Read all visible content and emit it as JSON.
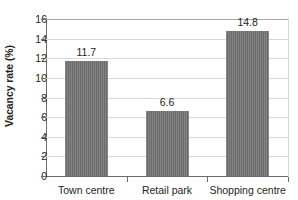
{
  "chart_data": {
    "type": "bar",
    "title": "",
    "xlabel": "",
    "ylabel": "Vacancy rate (%)",
    "categories": [
      "Town centre",
      "Retail park",
      "Shopping centre"
    ],
    "values": [
      11.7,
      6.6,
      14.8
    ],
    "value_labels": [
      "11.7",
      "6.6",
      "14.8"
    ],
    "ylim": [
      0,
      16
    ],
    "yticks": [
      0,
      2,
      4,
      6,
      8,
      10,
      12,
      14,
      16
    ],
    "ytick_labels": [
      "0",
      "2",
      "4",
      "6",
      "8",
      "10",
      "12",
      "14",
      "16"
    ],
    "grid": true,
    "legend": "none",
    "bar_color": "#6f6f6f",
    "gridline_color": "#d7d7d7",
    "axis_color": "#6d6d6d",
    "text_color": "#231f20",
    "background_color": "#ffffff"
  }
}
